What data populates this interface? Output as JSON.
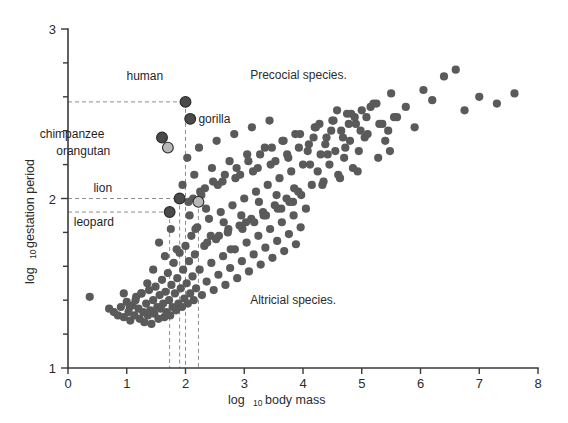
{
  "chart_data": {
    "type": "scatter",
    "title": "",
    "xlabel": "log 10 body mass",
    "xlabel_main": "log",
    "xlabel_sub": "10",
    "xlabel_rest": "body mass",
    "ylabel": "log 10 gestation period",
    "ylabel_main": "log",
    "ylabel_sub": "10",
    "ylabel_rest": "gestation period",
    "xlim": [
      0,
      8
    ],
    "ylim": [
      1,
      3
    ],
    "xticks": [
      0,
      1,
      2,
      3,
      4,
      5,
      6,
      7,
      8
    ],
    "xtick_labels": [
      "0",
      "1",
      "2",
      "3",
      "4",
      "5",
      "6",
      "7",
      "8"
    ],
    "yticks": [
      1,
      2,
      3
    ],
    "ytick_labels": [
      "1",
      "2",
      "3"
    ],
    "yminor_ticks": [
      1.2,
      1.4,
      1.6,
      1.8,
      2.2,
      2.4,
      2.6,
      2.8
    ],
    "grid": false,
    "legend": "none",
    "point_color": "#5a5a5a",
    "highlight_dark_color": "#4a4a4a",
    "highlight_light_color": "#b8b8b8",
    "axis_color": "#3a3a3a",
    "guide_color": "#8d8d8d",
    "annotations": [
      {
        "text": "Precocial species.",
        "x": 3.1,
        "y": 2.73
      },
      {
        "text": "Altricial species.",
        "x": 3.1,
        "y": 1.4
      }
    ],
    "highlighted_species": [
      {
        "name": "human",
        "x": 2.0,
        "y": 2.57,
        "style": "dark",
        "label_x": 1.62,
        "label_y": 2.72,
        "guide_v": true,
        "guide_h": true
      },
      {
        "name": "gorilla",
        "x": 2.08,
        "y": 2.47,
        "style": "dark",
        "label_x": 2.22,
        "label_y": 2.47,
        "guide_v": false,
        "guide_h": false
      },
      {
        "name": "chimpanzee",
        "x": 1.6,
        "y": 2.36,
        "style": "dark",
        "label_x": 0.62,
        "label_y": 2.38,
        "guide_v": false,
        "guide_h": false
      },
      {
        "name": "orangutan",
        "x": 1.7,
        "y": 2.3,
        "style": "light",
        "label_x": 0.72,
        "label_y": 2.28,
        "guide_v": false,
        "guide_h": false
      },
      {
        "name": "lion",
        "x": 1.9,
        "y": 2.0,
        "style": "dark",
        "label_x": 0.75,
        "label_y": 2.06,
        "guide_v": true,
        "guide_h": true
      },
      {
        "name": "leopard",
        "x": 1.73,
        "y": 1.92,
        "style": "dark",
        "label_x": 0.78,
        "label_y": 1.86,
        "guide_v": true,
        "guide_h": true
      },
      {
        "name": "",
        "x": 2.22,
        "y": 1.98,
        "style": "light",
        "label_x": 0,
        "label_y": 0,
        "guide_v": true,
        "guide_h": false
      }
    ],
    "x": [
      0.37,
      0.7,
      0.78,
      0.85,
      0.9,
      0.95,
      1.0,
      1.03,
      1.06,
      1.1,
      1.13,
      1.16,
      1.2,
      1.22,
      1.25,
      1.28,
      1.3,
      1.33,
      1.36,
      1.38,
      1.4,
      1.42,
      1.45,
      1.47,
      1.49,
      1.52,
      1.54,
      1.56,
      1.58,
      1.6,
      1.62,
      1.64,
      1.66,
      1.68,
      1.7,
      1.72,
      1.74,
      1.76,
      1.78,
      1.8,
      1.82,
      1.84,
      1.86,
      1.88,
      1.9,
      1.92,
      1.94,
      1.96,
      1.98,
      2.0,
      2.02,
      2.04,
      2.06,
      2.08,
      2.1,
      2.12,
      2.14,
      2.16,
      2.18,
      2.2,
      2.24,
      2.28,
      2.32,
      2.36,
      2.4,
      2.44,
      2.48,
      2.52,
      2.56,
      2.6,
      2.64,
      2.68,
      2.72,
      2.76,
      2.8,
      2.84,
      2.88,
      2.92,
      2.96,
      3.0,
      3.04,
      3.08,
      3.12,
      3.16,
      3.2,
      3.24,
      3.28,
      3.32,
      3.36,
      3.4,
      3.44,
      3.48,
      3.52,
      3.56,
      3.6,
      3.64,
      3.68,
      3.72,
      3.76,
      3.8,
      3.84,
      3.88,
      3.92,
      3.96,
      4.0,
      4.05,
      4.1,
      4.15,
      4.2,
      4.25,
      4.3,
      4.35,
      4.4,
      4.45,
      4.5,
      4.55,
      4.6,
      4.65,
      4.7,
      4.75,
      4.8,
      4.85,
      4.9,
      4.95,
      5.0,
      5.1,
      5.2,
      5.3,
      5.4,
      5.5,
      5.6,
      5.75,
      5.9,
      6.05,
      6.2,
      6.4,
      6.6,
      6.75,
      7.0,
      7.3,
      7.6,
      1.95,
      2.05,
      2.15,
      2.25,
      2.35,
      2.45,
      2.55,
      2.65,
      2.75,
      2.85,
      2.95,
      3.05,
      3.15,
      3.25,
      3.35,
      3.45,
      3.55,
      3.65,
      3.75,
      3.85,
      3.95,
      4.08,
      4.22,
      4.38,
      4.52,
      4.68,
      4.82,
      4.98,
      5.15,
      5.35,
      5.55,
      1.55,
      1.65,
      1.75,
      1.85,
      2.03,
      2.13,
      2.23,
      2.33,
      2.43,
      2.53,
      2.63,
      2.73,
      2.83,
      2.93,
      3.03,
      3.13,
      3.23,
      3.33,
      3.43,
      3.53,
      3.63,
      3.73,
      3.83,
      3.93,
      4.12,
      4.28,
      4.42,
      4.58,
      4.72,
      4.88,
      5.05,
      5.25,
      5.45,
      2.07,
      2.17,
      2.27,
      2.37,
      2.47,
      2.57,
      2.67,
      2.77,
      2.87,
      2.97,
      3.07,
      3.17,
      3.27,
      3.37,
      3.47,
      3.57,
      3.67,
      3.77,
      3.87,
      3.97,
      4.18,
      4.33,
      4.48,
      4.63,
      4.78,
      4.93,
      5.08,
      5.28,
      5.48,
      1.45,
      1.35,
      1.25,
      1.15,
      1.05,
      0.95
    ],
    "y": [
      1.42,
      1.35,
      1.33,
      1.31,
      1.36,
      1.3,
      1.39,
      1.33,
      1.28,
      1.37,
      1.31,
      1.42,
      1.35,
      1.29,
      1.44,
      1.33,
      1.27,
      1.38,
      1.31,
      1.46,
      1.34,
      1.26,
      1.4,
      1.32,
      1.48,
      1.36,
      1.29,
      1.43,
      1.35,
      1.52,
      1.38,
      1.3,
      1.45,
      1.33,
      1.56,
      1.4,
      1.31,
      1.49,
      1.36,
      1.62,
      1.44,
      1.34,
      1.53,
      1.38,
      1.68,
      1.47,
      1.36,
      1.58,
      1.41,
      1.72,
      1.5,
      1.38,
      1.63,
      1.44,
      1.78,
      1.54,
      1.4,
      1.67,
      1.47,
      1.83,
      1.58,
      1.43,
      1.72,
      1.51,
      1.88,
      1.62,
      1.46,
      1.76,
      1.55,
      1.92,
      1.66,
      1.49,
      1.8,
      1.59,
      1.96,
      1.7,
      1.53,
      1.84,
      1.63,
      2.0,
      1.74,
      1.57,
      1.88,
      1.67,
      2.04,
      1.78,
      1.61,
      1.92,
      1.71,
      2.08,
      1.82,
      1.65,
      1.96,
      1.75,
      2.12,
      1.86,
      1.69,
      2.0,
      1.79,
      2.16,
      1.9,
      1.73,
      2.04,
      1.83,
      2.2,
      1.94,
      2.32,
      2.08,
      2.42,
      2.16,
      2.26,
      2.1,
      2.36,
      2.2,
      2.46,
      2.28,
      2.14,
      2.4,
      2.24,
      2.5,
      2.34,
      2.18,
      2.44,
      2.28,
      2.52,
      2.38,
      2.56,
      2.44,
      2.34,
      2.62,
      2.48,
      2.54,
      2.42,
      2.64,
      2.58,
      2.72,
      2.76,
      2.52,
      2.6,
      2.56,
      2.62,
      2.08,
      1.98,
      2.14,
      2.04,
      1.94,
      2.18,
      2.08,
      1.86,
      2.22,
      2.12,
      1.9,
      2.26,
      2.16,
      1.98,
      2.3,
      2.2,
      2.02,
      2.34,
      2.24,
      2.06,
      2.38,
      2.28,
      2.42,
      2.32,
      2.46,
      2.36,
      2.5,
      2.4,
      2.54,
      2.44,
      2.48,
      1.74,
      1.66,
      1.82,
      1.7,
      2.24,
      2.0,
      2.3,
      2.06,
      1.78,
      2.34,
      2.1,
      1.82,
      2.38,
      2.14,
      1.86,
      2.42,
      2.18,
      1.9,
      2.46,
      2.22,
      1.94,
      2.26,
      1.98,
      2.3,
      2.2,
      2.44,
      2.26,
      2.52,
      2.3,
      2.48,
      2.36,
      2.56,
      2.4,
      1.9,
      1.82,
      2.02,
      1.74,
      2.1,
      1.78,
      2.14,
      1.7,
      2.18,
      1.82,
      2.22,
      1.86,
      2.26,
      1.9,
      2.3,
      1.94,
      2.34,
      1.98,
      2.38,
      2.02,
      2.36,
      2.08,
      2.4,
      2.12,
      2.44,
      2.16,
      2.48,
      2.24,
      2.28,
      1.58,
      1.5,
      1.44,
      1.4,
      1.36,
      1.44
    ]
  }
}
